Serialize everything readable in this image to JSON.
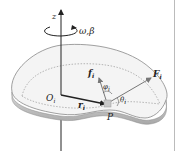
{
  "diagram": {
    "type": "rigid body rotation about fixed axis",
    "labels": {
      "axis": "z",
      "angular": "ω",
      "angular_sep": ",",
      "angular_acc": "β",
      "origin": "O",
      "origin_sub": "i",
      "radius": "r",
      "radius_sub": "i",
      "point": "P",
      "internal_force": "f",
      "internal_force_sub": "i",
      "external_force": "F",
      "external_force_sub": "i",
      "angle_phi": "φ",
      "angle_phi_sub": "i",
      "angle_theta": "θ",
      "angle_theta_sub": "i"
    },
    "colors": {
      "line": "#222222",
      "body_top": "#f4f4f4",
      "body_edge": "#bdbdbd",
      "dotted": "#9a9a9a",
      "point_fill": "#c9c9c9",
      "arrow_gray": "#777777"
    }
  }
}
